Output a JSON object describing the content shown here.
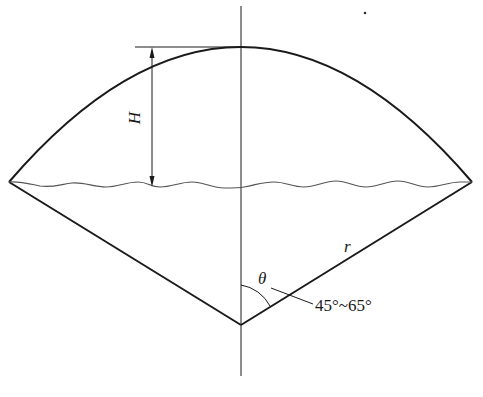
{
  "diagram": {
    "type": "conical-shell-cross-section",
    "labels": {
      "height": "H",
      "radius": "r",
      "angle": "θ",
      "angle_range": "45°~65°"
    },
    "colors": {
      "stroke": "#1a1a1a",
      "wave": "#555555",
      "background": "#ffffff"
    }
  }
}
